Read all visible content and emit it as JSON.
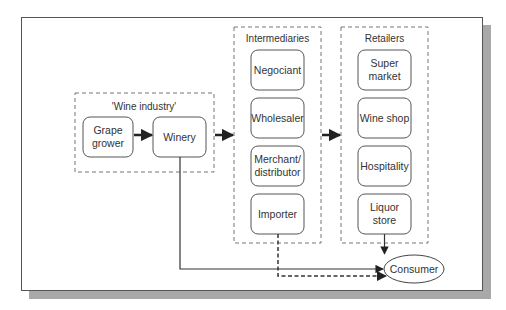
{
  "diagram": {
    "type": "flowchart",
    "groups": {
      "wine_industry": {
        "label": "'Wine industry'",
        "nodes": [
          {
            "id": "grape_grower",
            "line1": "Grape",
            "line2": "grower"
          },
          {
            "id": "winery",
            "line1": "Winery",
            "line2": ""
          }
        ]
      },
      "intermediaries": {
        "label": "Intermediaries",
        "nodes": [
          {
            "id": "negociant",
            "line1": "Negociant",
            "line2": ""
          },
          {
            "id": "wholesaler",
            "line1": "Wholesaler",
            "line2": ""
          },
          {
            "id": "merchant_distributor",
            "line1": "Merchant/",
            "line2": "distributor"
          },
          {
            "id": "importer",
            "line1": "Importer",
            "line2": ""
          }
        ]
      },
      "retailers": {
        "label": "Retailers",
        "nodes": [
          {
            "id": "supermarket",
            "line1": "Super",
            "line2": "market"
          },
          {
            "id": "wine_shop",
            "line1": "Wine shop",
            "line2": ""
          },
          {
            "id": "hospitality",
            "line1": "Hospitality",
            "line2": ""
          },
          {
            "id": "liquor_store",
            "line1": "Liquor",
            "line2": "store"
          }
        ]
      }
    },
    "consumer": {
      "label": "Consumer"
    },
    "edges": [
      {
        "from": "grape_grower",
        "to": "winery",
        "style": "solid-thick"
      },
      {
        "from": "wine_industry",
        "to": "intermediaries",
        "style": "solid-thick"
      },
      {
        "from": "intermediaries",
        "to": "retailers",
        "style": "solid-thick"
      },
      {
        "from": "winery",
        "to": "consumer",
        "style": "solid"
      },
      {
        "from": "importer",
        "to": "consumer",
        "style": "dashed"
      },
      {
        "from": "liquor_store",
        "to": "consumer",
        "style": "solid"
      }
    ],
    "colors": {
      "line": "#333333",
      "dashed_border": "#777777",
      "shadow": "#a9a9a9"
    }
  }
}
